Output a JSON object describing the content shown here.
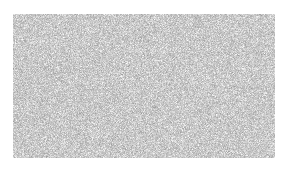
{
  "image": {
    "kind": "noise-texture-swatch",
    "width": 287,
    "height": 172,
    "background_color": "#ffffff",
    "alt_text": "Rectangular patch of fine-grained gray noise texture on a white background",
    "caption": "",
    "text_content": "",
    "ui_controls": []
  },
  "swatch": {
    "label": "",
    "x": 13,
    "y": 14,
    "width": 262,
    "height": 144,
    "shape": "rectangle",
    "corner_radius": 0,
    "border": "none",
    "texture": {
      "type": "random-grayscale-noise",
      "grain_size_px": 1,
      "base_color": "#c9c9c9",
      "min_gray": "#9a9a9a",
      "max_gray": "#ffffff",
      "mean_gray": "#c8c8c8",
      "seed": 20240517,
      "opacity": 1
    }
  }
}
